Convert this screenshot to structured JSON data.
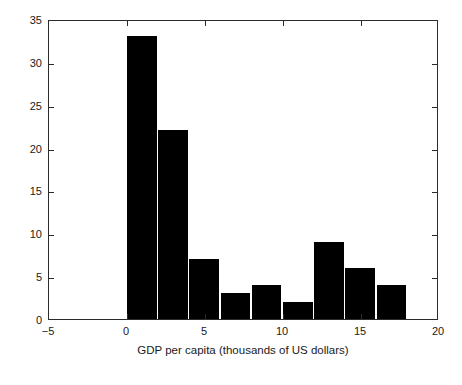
{
  "chart_data": {
    "type": "bar",
    "title": "",
    "xlabel": "GDP per capita (thousands of US dollars)",
    "ylabel": "Frequency",
    "xlim": [
      -5,
      20
    ],
    "ylim": [
      0,
      35
    ],
    "xticks": [
      -5,
      0,
      5,
      10,
      15,
      20
    ],
    "xtick_labels": [
      "−5",
      "0",
      "5",
      "10",
      "15",
      "20"
    ],
    "yticks": [
      0,
      5,
      10,
      15,
      20,
      25,
      30,
      35
    ],
    "ytick_labels": [
      "0",
      "5",
      "10",
      "15",
      "20",
      "25",
      "30",
      "35"
    ],
    "grid": false,
    "legend": null,
    "bar_color": "#000000",
    "bin_width": 1.9,
    "bins": [
      {
        "x_left": 0.0,
        "x_right": 1.9,
        "center": 0.95,
        "value": 33
      },
      {
        "x_left": 2.0,
        "x_right": 3.9,
        "center": 2.95,
        "value": 22
      },
      {
        "x_left": 4.0,
        "x_right": 5.9,
        "center": 4.95,
        "value": 7
      },
      {
        "x_left": 6.0,
        "x_right": 7.9,
        "center": 6.95,
        "value": 3
      },
      {
        "x_left": 8.0,
        "x_right": 9.9,
        "center": 8.95,
        "value": 4
      },
      {
        "x_left": 10.0,
        "x_right": 11.9,
        "center": 10.95,
        "value": 2
      },
      {
        "x_left": 12.0,
        "x_right": 13.9,
        "center": 12.95,
        "value": 9
      },
      {
        "x_left": 14.0,
        "x_right": 15.9,
        "center": 14.95,
        "value": 6
      },
      {
        "x_left": 16.0,
        "x_right": 17.9,
        "center": 16.95,
        "value": 4
      }
    ],
    "categories": [
      "0–2",
      "2–4",
      "4–6",
      "6–8",
      "8–10",
      "10–12",
      "12–14",
      "14–16",
      "16–18"
    ],
    "values": [
      33,
      22,
      7,
      3,
      4,
      2,
      9,
      6,
      4
    ]
  }
}
